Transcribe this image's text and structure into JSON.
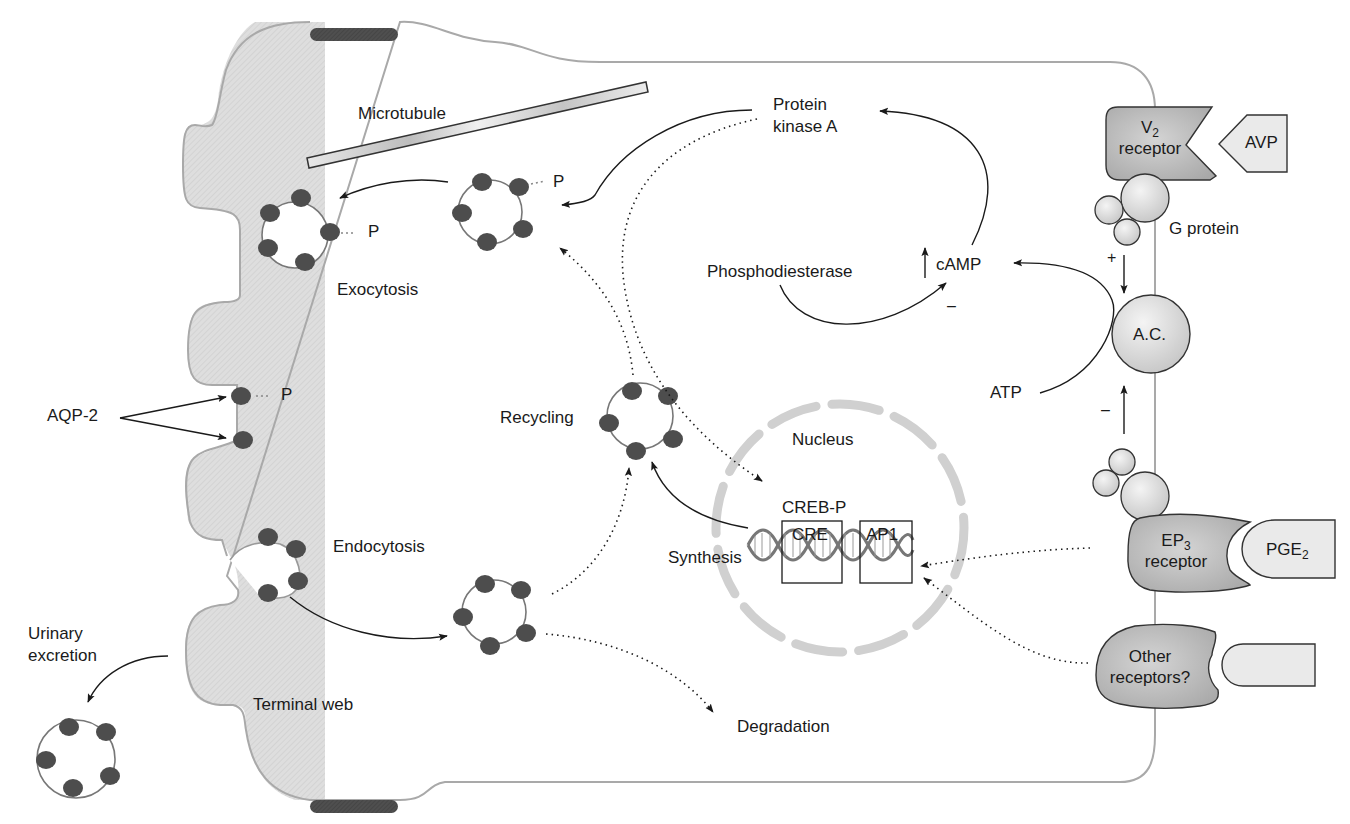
{
  "colors": {
    "membrane": "#a9a9a9",
    "terminal_web_fill": "#dcdcdc",
    "aqp2_particle": "#4d4d4d",
    "tight_junction": "#4a4a4a",
    "receptor_fill": "#bdbdbd",
    "ligand_fill": "#eaeaea",
    "nuclear_envelope": "#cfcfcf",
    "arrow": "#1a1a1a"
  },
  "labels": {
    "microtubule": "Microtubule",
    "protein_kinase_a_line1": "Protein",
    "protein_kinase_a_line2": "kinase A",
    "phosphodiesterase": "Phosphodiesterase",
    "camp": "cAMP",
    "camp_increase_symbol": "↑",
    "pde_inhibition_sign": "–",
    "exocytosis": "Exocytosis",
    "phospho_p": "P",
    "aqp2": "AQP-2",
    "recycling": "Recycling",
    "endocytosis": "Endocytosis",
    "urinary_excretion_line1": "Urinary",
    "urinary_excretion_line2": "excretion",
    "terminal_web": "Terminal web",
    "degradation": "Degradation",
    "synthesis": "Synthesis",
    "nucleus": "Nucleus",
    "creb_p": "CREB-P",
    "cre": "CRE",
    "ap1": "AP1",
    "atp": "ATP",
    "adenylyl_cyclase": "A.C.",
    "g_protein": "G protein",
    "stimulation_sign": "+",
    "inhibition_sign": "–"
  },
  "receptors": {
    "v2": {
      "name": "V",
      "subscript": "2",
      "line2": "receptor",
      "ligand": "AVP"
    },
    "ep3": {
      "name": "EP",
      "subscript": "3",
      "line2": "receptor",
      "ligand": "PGE",
      "ligand_subscript": "2"
    },
    "other": {
      "line1": "Other",
      "line2": "receptors?",
      "ligand": ""
    }
  }
}
